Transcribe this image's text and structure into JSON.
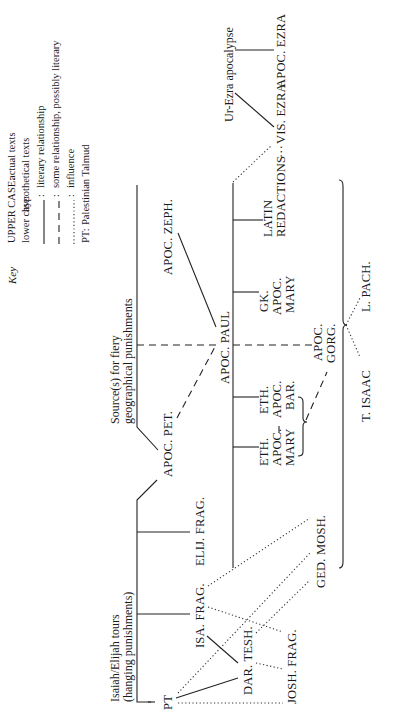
{
  "key": {
    "title": "Key",
    "entries": [
      {
        "label": "UPPER CASE:",
        "meaning": "actual texts"
      },
      {
        "label": "lower case:",
        "meaning": "hypothetical texts"
      },
      {
        "line_style": "solid",
        "meaning": "literary relationship"
      },
      {
        "line_style": "dashed",
        "meaning": "some relationship, possibly literary"
      },
      {
        "line_style": "dotted",
        "meaning": "influence"
      },
      {
        "label": "PT:",
        "meaning": "Palestinian Talmud"
      }
    ]
  },
  "nodes": {
    "isaiah_elijah": {
      "line1": "Isaiah/Elijah tours",
      "line2": "(hanging punishments)"
    },
    "source_fiery": {
      "line1": "Source(s) for fiery",
      "line2": "geographical punishments"
    },
    "ur_ezra": "Ur-Ezra apocalypse",
    "pt": "PT",
    "isa_frag": "ISA. FRAG.",
    "elij_frag": "ELIJ. FRAG.",
    "dar_tesh": "DAR. TESH.",
    "josh_frag": "JOSH. FRAG.",
    "ged_mosh": "GED. MOSH.",
    "apoc_pet": "APOC. PET.",
    "apoc_zeph": "APOC. ZEPH.",
    "apoc_paul": "APOC. PAUL",
    "eth_apoc_mary": [
      "ETH.",
      "APOC.",
      "MARY"
    ],
    "eth_apoc_bar": [
      "ETH.",
      "APOC.",
      "BAR."
    ],
    "gk_apoc_mary": [
      "GK.",
      "APOC.",
      "MARY"
    ],
    "latin_redactions": [
      "LATIN",
      "REDACTIONS"
    ],
    "vis_ezra": "VIS. EZRA",
    "apoc_ezra": "APOC. EZRA",
    "apoc_gorg": [
      "APOC.",
      "GORG."
    ],
    "t_isaac": "T. ISAAC",
    "l_pach": "L. PACH.",
    "dots_connector": "···"
  },
  "edges": [
    {
      "from": "isaiah_elijah",
      "to": "elij_frag",
      "style": "solid"
    },
    {
      "from": "isaiah_elijah",
      "to": "isa_frag",
      "style": "solid"
    },
    {
      "from": "isaiah_elijah",
      "to": "apoc_pet",
      "style": "solid"
    },
    {
      "from": "isaiah_elijah",
      "to": "pt",
      "style": "dashed"
    },
    {
      "from": "source_fiery",
      "to": "apoc_pet",
      "style": "solid"
    },
    {
      "from": "source_fiery",
      "to": "apoc_paul",
      "style": "dashed"
    },
    {
      "from": "apoc_pet",
      "to": "apoc_paul",
      "style": "dashed"
    },
    {
      "from": "apoc_zeph",
      "to": "apoc_paul",
      "style": "solid"
    },
    {
      "from": "apoc_paul",
      "to": "latin_redactions",
      "style": "solid"
    },
    {
      "from": "apoc_paul",
      "to": "gk_apoc_mary",
      "style": "solid"
    },
    {
      "from": "apoc_paul",
      "to": "eth_apoc_bar",
      "style": "solid"
    },
    {
      "from": "apoc_paul",
      "to": "eth_apoc_mary",
      "style": "solid"
    },
    {
      "from": "apoc_paul",
      "to": "apoc_gorg",
      "style": "dashed"
    },
    {
      "from": "eth_apoc_mary",
      "to": "eth_apoc_bar",
      "style": "dashed"
    },
    {
      "from": "eth_group",
      "to": "apoc_gorg",
      "style": "dashed"
    },
    {
      "from": "apoc_paul",
      "to": "vis_ezra",
      "style": "dotted"
    },
    {
      "from": "latin_redactions",
      "to": "vis_ezra",
      "style": "dotted"
    },
    {
      "from": "ur_ezra",
      "to": "vis_ezra",
      "style": "solid"
    },
    {
      "from": "ur_ezra",
      "to": "apoc_ezra",
      "style": "solid"
    },
    {
      "from": "apoc_paul_group",
      "to": "t_isaac",
      "style": "dotted"
    },
    {
      "from": "apoc_paul_group",
      "to": "l_pach",
      "style": "dotted"
    },
    {
      "from": "pt",
      "to": "dar_tesh",
      "style": "solid"
    },
    {
      "from": "isa_frag",
      "to": "dar_tesh",
      "style": "solid"
    },
    {
      "from": "pt",
      "to": "josh_frag",
      "style": "dotted"
    },
    {
      "from": "pt",
      "to": "ged_mosh",
      "style": "dotted"
    },
    {
      "from": "isa_frag",
      "to": "ged_mosh",
      "style": "dotted"
    },
    {
      "from": "isa_frag",
      "to": "josh_frag",
      "style": "dotted"
    },
    {
      "from": "dar_tesh",
      "to": "ged_mosh",
      "style": "dotted"
    },
    {
      "from": "dar_tesh",
      "to": "josh_frag",
      "style": "dotted"
    }
  ]
}
